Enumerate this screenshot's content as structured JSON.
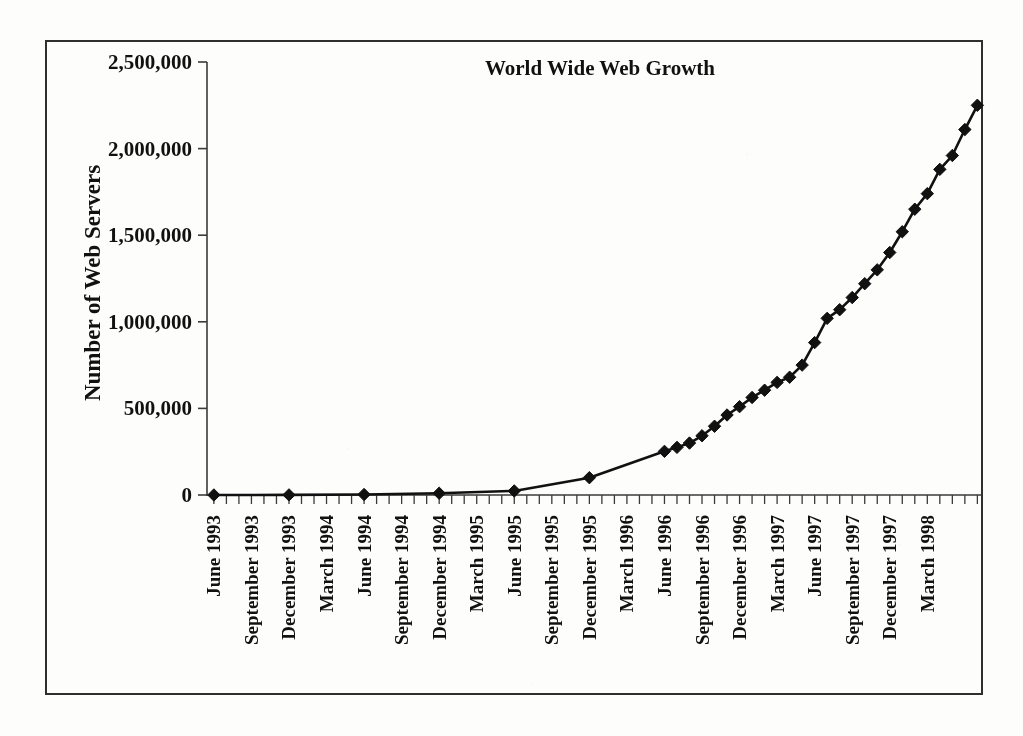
{
  "figure": {
    "background_color": "#fdfdfc",
    "ink_color": "#111111",
    "border_color": "#2f2f2f"
  },
  "chart_data": {
    "type": "line",
    "title": "World Wide Web Growth",
    "xlabel": "",
    "ylabel": "Number of Web Servers",
    "ylim": [
      0,
      2500000
    ],
    "ytick_labels": [
      "0",
      "500,000",
      "1,000,000",
      "1,500,000",
      "2,000,000",
      "2,500,000"
    ],
    "ytick_values": [
      0,
      500000,
      1000000,
      1500000,
      2000000,
      2500000
    ],
    "grid": false,
    "legend": false,
    "marker": "diamond",
    "line_color": "#111111",
    "marker_color": "#111111",
    "xtick_labels": [
      "June 1993",
      "September 1993",
      "December 1993",
      "March 1994",
      "June 1994",
      "September 1994",
      "December 1994",
      "March 1995",
      "June 1995",
      "September 1995",
      "December 1995",
      "March 1996",
      "June 1996",
      "September 1996",
      "December 1996",
      "March 1997",
      "June 1997",
      "September 1997",
      "December 1997",
      "March 1998"
    ],
    "x_month_index_of_labels": [
      0,
      3,
      6,
      9,
      12,
      15,
      18,
      21,
      24,
      27,
      30,
      33,
      36,
      39,
      42,
      45,
      48,
      51,
      54,
      57
    ],
    "points": [
      {
        "month_index": 0,
        "label": "June 1993",
        "value": 130
      },
      {
        "month_index": 6,
        "label": "December 1993",
        "value": 623
      },
      {
        "month_index": 12,
        "label": "June 1994",
        "value": 2738
      },
      {
        "month_index": 18,
        "label": "December 1994",
        "value": 10022
      },
      {
        "month_index": 24,
        "label": "June 1995",
        "value": 23500
      },
      {
        "month_index": 30,
        "label": "December 1995",
        "value": 100000
      },
      {
        "month_index": 36,
        "label": "June 1996",
        "value": 252000
      },
      {
        "month_index": 37,
        "label": "July 1996",
        "value": 275000
      },
      {
        "month_index": 38,
        "label": "August 1996",
        "value": 300000
      },
      {
        "month_index": 39,
        "label": "September 1996",
        "value": 342000
      },
      {
        "month_index": 40,
        "label": "October 1996",
        "value": 397000
      },
      {
        "month_index": 41,
        "label": "November 1996",
        "value": 462000
      },
      {
        "month_index": 42,
        "label": "December 1996",
        "value": 510000
      },
      {
        "month_index": 43,
        "label": "January 1997",
        "value": 563000
      },
      {
        "month_index": 44,
        "label": "February 1997",
        "value": 605000
      },
      {
        "month_index": 45,
        "label": "March 1997",
        "value": 650000
      },
      {
        "month_index": 46,
        "label": "April 1997",
        "value": 680000
      },
      {
        "month_index": 47,
        "label": "May 1997",
        "value": 750000
      },
      {
        "month_index": 48,
        "label": "June 1997",
        "value": 880000
      },
      {
        "month_index": 49,
        "label": "July 1997",
        "value": 1020000
      },
      {
        "month_index": 50,
        "label": "August 1997",
        "value": 1070000
      },
      {
        "month_index": 51,
        "label": "September 1997",
        "value": 1140000
      },
      {
        "month_index": 52,
        "label": "October 1997",
        "value": 1220000
      },
      {
        "month_index": 53,
        "label": "November 1997",
        "value": 1300000
      },
      {
        "month_index": 54,
        "label": "December 1997",
        "value": 1400000
      },
      {
        "month_index": 55,
        "label": "January 1998",
        "value": 1520000
      },
      {
        "month_index": 56,
        "label": "February 1998",
        "value": 1650000
      },
      {
        "month_index": 57,
        "label": "March 1998",
        "value": 1740000
      },
      {
        "month_index": 58,
        "label": "April 1998",
        "value": 1880000
      },
      {
        "month_index": 59,
        "label": "May 1998",
        "value": 1960000
      },
      {
        "month_index": 60,
        "label": "June 1998",
        "value": 2110000
      },
      {
        "month_index": 61,
        "label": "July 1998",
        "value": 2250000
      }
    ]
  }
}
